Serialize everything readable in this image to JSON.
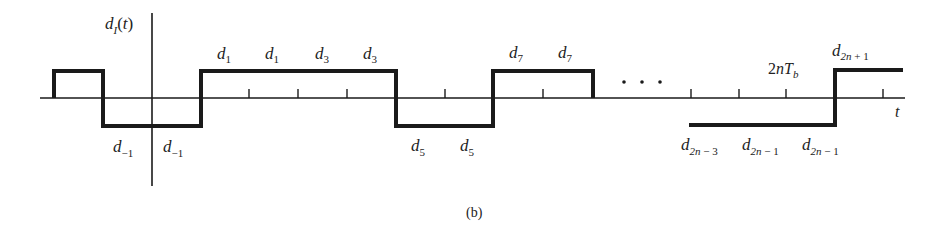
{
  "diagram": {
    "y_axis_label": "d_I(t)",
    "x_axis_label": "t",
    "caption": "(b)",
    "ellipsis": ". . .",
    "tick_label": "2nT_b",
    "labels_above": [
      {
        "base": "d",
        "sub": "1"
      },
      {
        "base": "d",
        "sub": "1"
      },
      {
        "base": "d",
        "sub": "3"
      },
      {
        "base": "d",
        "sub": "3"
      },
      {
        "base": "d",
        "sub": "7"
      },
      {
        "base": "d",
        "sub": "7"
      },
      {
        "base": "d",
        "sub": "2n + 1"
      }
    ],
    "labels_below": [
      {
        "base": "d",
        "sub": "−1"
      },
      {
        "base": "d",
        "sub": "−1"
      },
      {
        "base": "d",
        "sub": "5"
      },
      {
        "base": "d",
        "sub": "5"
      },
      {
        "base": "d",
        "sub": "2n − 3"
      },
      {
        "base": "d",
        "sub": "2n − 1"
      },
      {
        "base": "d",
        "sub": "2n − 1"
      }
    ],
    "waveform_levels": [
      "+",
      "−",
      "−",
      "+",
      "+",
      "+",
      "+",
      "−",
      "−",
      "+",
      "+",
      "...",
      "−",
      "−",
      "−",
      "+"
    ],
    "colors": {
      "line": "#1a1a1a",
      "text": "#222222",
      "background": "#ffffff"
    }
  }
}
